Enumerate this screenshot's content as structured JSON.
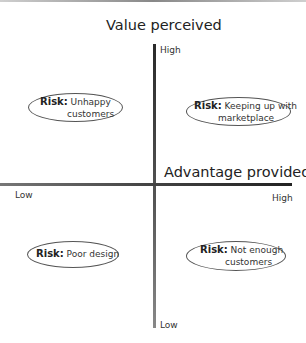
{
  "diagram": {
    "y_axis": {
      "title": "Value perceived",
      "high_label": "High",
      "low_label": "Low"
    },
    "x_axis": {
      "title": "Advantage provided",
      "high_label": "High",
      "low_label": "Low"
    },
    "quadrants": {
      "top_left": {
        "risk_label": "Risk:",
        "line1": "Unhappy",
        "line2": "customers"
      },
      "top_right": {
        "risk_label": "Risk:",
        "line1": "Keeping up with",
        "line2": "marketplace"
      },
      "bottom_left": {
        "risk_label": "Risk:",
        "line1": "Poor design",
        "line2": ""
      },
      "bottom_right": {
        "risk_label": "Risk:",
        "line1": "Not enough",
        "line2": "customers"
      }
    }
  }
}
